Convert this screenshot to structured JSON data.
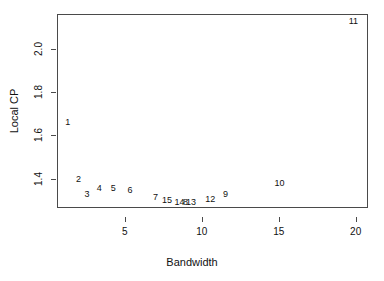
{
  "chart_data": {
    "type": "scatter",
    "title": "",
    "xlabel": "Bandwidth",
    "ylabel": "Local CP",
    "xlim": [
      0.6,
      20.8
    ],
    "ylim": [
      1.265,
      2.16
    ],
    "grid": false,
    "legend": null,
    "marker_style": "text-labels",
    "xticks": [
      5,
      10,
      15,
      20
    ],
    "xticklabels": [
      "5",
      "10",
      "15",
      "20"
    ],
    "yticks": [
      1.4,
      1.6,
      1.8,
      2.0
    ],
    "yticklabels": [
      "1.4",
      "1.6",
      "1.8",
      "2.0"
    ],
    "points": [
      {
        "label": "1",
        "x": 1.3,
        "y": 1.663
      },
      {
        "label": "2",
        "x": 2.0,
        "y": 1.398
      },
      {
        "label": "3",
        "x": 2.55,
        "y": 1.33
      },
      {
        "label": "4",
        "x": 3.35,
        "y": 1.358
      },
      {
        "label": "5",
        "x": 4.25,
        "y": 1.358
      },
      {
        "label": "6",
        "x": 5.35,
        "y": 1.347
      },
      {
        "label": "7",
        "x": 7.0,
        "y": 1.318
      },
      {
        "label": "15",
        "x": 7.75,
        "y": 1.3
      },
      {
        "label": "14",
        "x": 8.55,
        "y": 1.292
      },
      {
        "label": "8",
        "x": 8.95,
        "y": 1.292
      },
      {
        "label": "13",
        "x": 9.3,
        "y": 1.294
      },
      {
        "label": "12",
        "x": 10.55,
        "y": 1.308
      },
      {
        "label": "9",
        "x": 11.55,
        "y": 1.33
      },
      {
        "label": "10",
        "x": 15.05,
        "y": 1.381
      },
      {
        "label": "11",
        "x": 19.85,
        "y": 2.128
      }
    ]
  },
  "style": {
    "axis_color": "#4a4a4a",
    "text_color": "#111111",
    "background": "#ffffff"
  }
}
